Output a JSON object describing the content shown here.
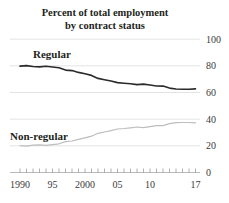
{
  "chart": {
    "title_line1": "Percent of total employment",
    "title_line2": "by contract status",
    "labels": {
      "regular": "Regular",
      "non_regular": "Non-regular"
    },
    "colors": {
      "regular_line": "#2b2b2b",
      "non_regular_line": "#bdbdbd",
      "gridline": "#d9d9d9",
      "axis_line": "#a8a8a8",
      "tick": "#8f8f8f",
      "text": "#231f20"
    }
  },
  "chart_data": {
    "type": "line",
    "title": "Percent of total employment by contract status",
    "xlabel": "",
    "ylabel": "",
    "ylim": [
      0,
      100
    ],
    "y_ticks": [
      0,
      20,
      40,
      60,
      80,
      100
    ],
    "y_axis_side": "right",
    "grid": "horizontal",
    "legend": "inline-labels",
    "x": [
      1990,
      1991,
      1992,
      1993,
      1994,
      1995,
      1996,
      1997,
      1998,
      1999,
      2000,
      2001,
      2002,
      2003,
      2004,
      2005,
      2006,
      2007,
      2008,
      2009,
      2010,
      2011,
      2012,
      2013,
      2014,
      2015,
      2016,
      2017
    ],
    "x_tick_years": [
      1990,
      1991,
      1992,
      1993,
      1994,
      1995,
      1996,
      1997,
      1998,
      1999,
      2000,
      2001,
      2002,
      2003,
      2004,
      2005,
      2006,
      2007,
      2008,
      2009,
      2010,
      2011,
      2012,
      2013,
      2014,
      2015,
      2016,
      2017
    ],
    "x_labeled_ticks": [
      {
        "year": 1990,
        "text": "1990"
      },
      {
        "year": 1995,
        "text": "95"
      },
      {
        "year": 2000,
        "text": "2000"
      },
      {
        "year": 2005,
        "text": "05"
      },
      {
        "year": 2010,
        "text": "10"
      },
      {
        "year": 2017,
        "text": "17"
      }
    ],
    "series": [
      {
        "name": "Regular",
        "values": [
          79.8,
          80.2,
          79.5,
          79.2,
          79.7,
          79.1,
          78.5,
          76.8,
          76.4,
          75.1,
          74.0,
          72.8,
          70.6,
          69.6,
          68.6,
          67.4,
          67.0,
          66.5,
          65.9,
          66.3,
          65.6,
          64.9,
          64.8,
          63.3,
          62.6,
          62.5,
          62.5,
          62.7
        ]
      },
      {
        "name": "Non-regular",
        "values": [
          20.2,
          19.8,
          20.5,
          20.8,
          20.3,
          20.9,
          21.5,
          23.2,
          23.6,
          24.9,
          26.0,
          27.2,
          29.4,
          30.4,
          31.4,
          32.6,
          33.0,
          33.5,
          34.1,
          33.7,
          34.4,
          35.1,
          35.2,
          36.7,
          37.4,
          37.5,
          37.5,
          37.3
        ]
      }
    ]
  }
}
